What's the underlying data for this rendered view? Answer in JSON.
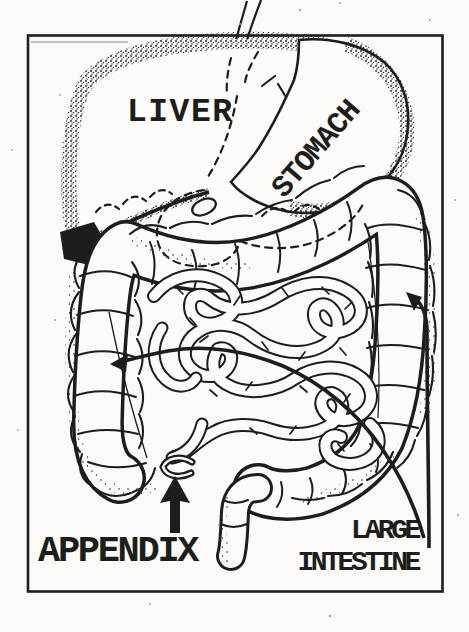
{
  "diagram": {
    "kind": "digestive-system-line-drawing",
    "colors": {
      "ink": "#1d1d1b",
      "paper": "#fcfbf8"
    },
    "labels": {
      "liver": "LIVER",
      "stomach": "STOMACH",
      "appendix": "APPENDIX",
      "large_intestine": [
        "LARGE",
        "INTESTINE"
      ]
    },
    "callouts": [
      {
        "label": "APPENDIX",
        "arrow": "thick arrow pointing up at the appendix"
      },
      {
        "label": "LARGE INTESTINE",
        "arrow": "long curved arrow sweeping left into the colon"
      },
      {
        "label": "LARGE INTESTINE",
        "arrow": "curved arrow pointing up-left at the right colon"
      }
    ]
  }
}
